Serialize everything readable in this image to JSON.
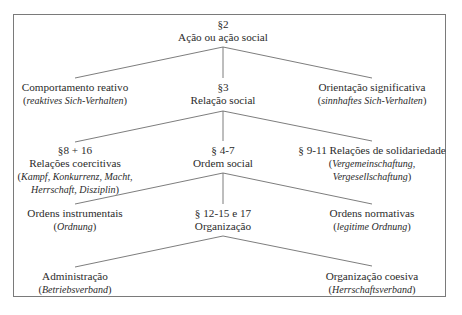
{
  "diagram": {
    "root": {
      "section": "§2",
      "label": "Ação ou ação social"
    },
    "level1": {
      "left": {
        "label": "Comportamento reativo",
        "german": "reaktives Sich-Verhalten"
      },
      "center": {
        "section": "§3",
        "label": "Relação social"
      },
      "right": {
        "label": "Orientação significativa",
        "german": "sinnhaftes Sich-Verhalten"
      }
    },
    "level2": {
      "left": {
        "section": "§8 + 16",
        "label": "Relações coercitivas",
        "german_line1": "Kampf, Konkurrenz, Macht,",
        "german_line2": "Herrschaft, Disziplin"
      },
      "center": {
        "section": "§ 4-7",
        "label": "Ordem social"
      },
      "right": {
        "label": "§ 9-11 Relações de solidariedade",
        "german_line1": "Vergemeinschaftung,",
        "german_line2": "Vergesellschaftung"
      }
    },
    "level3": {
      "left": {
        "label": "Ordens instrumentais",
        "german": "Ordnung"
      },
      "center": {
        "section": "§ 12-15 e 17",
        "label": "Organização"
      },
      "right": {
        "label": "Ordens normativas",
        "german": "legitime Ordnung"
      }
    },
    "level4": {
      "left": {
        "label": "Administração",
        "german": "Betriebsverband"
      },
      "right": {
        "label": "Organização coesiva",
        "german": "Herrschaftsverband"
      }
    },
    "punctuation": {
      "open": "(",
      "close": ")"
    },
    "colors": {
      "line": "#6e6e6e",
      "border": "#7a7a7a",
      "text": "#2b2b2b"
    }
  }
}
